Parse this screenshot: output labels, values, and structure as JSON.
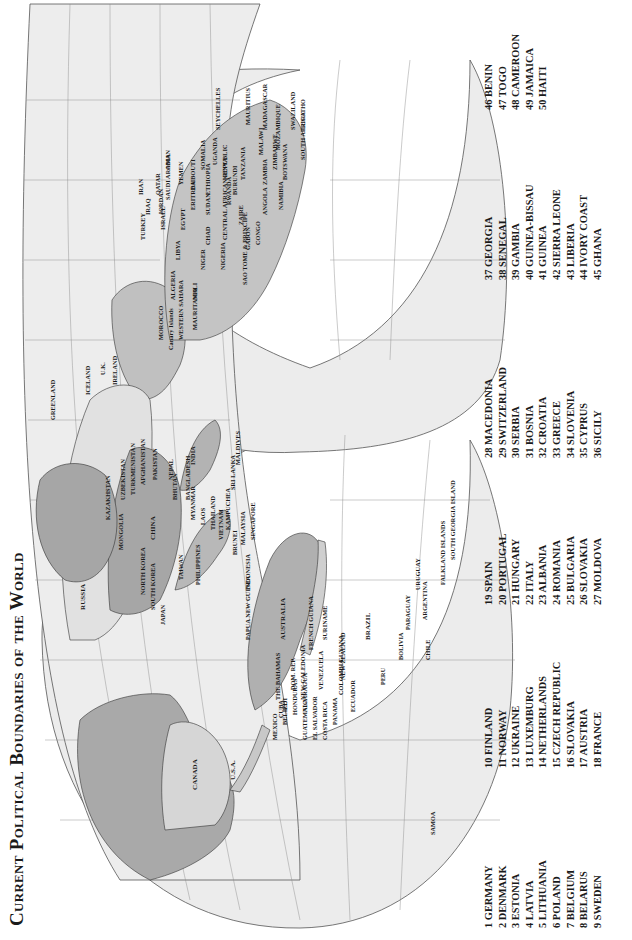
{
  "title": "Current Political Boundaries of the World",
  "legend": {
    "columns": [
      [
        {
          "num": 1,
          "name": "GERMANY"
        },
        {
          "num": 2,
          "name": "DENMARK"
        },
        {
          "num": 3,
          "name": "ESTONIA"
        },
        {
          "num": 4,
          "name": "LATVIA"
        },
        {
          "num": 5,
          "name": "LITHUANIA"
        },
        {
          "num": 6,
          "name": "POLAND"
        },
        {
          "num": 7,
          "name": "BELGIUM"
        },
        {
          "num": 8,
          "name": "BELARUS"
        },
        {
          "num": 9,
          "name": "SWEDEN"
        }
      ],
      [
        {
          "num": 10,
          "name": "FINLAND"
        },
        {
          "num": 11,
          "name": "NORWAY"
        },
        {
          "num": 12,
          "name": "UKRAINE"
        },
        {
          "num": 13,
          "name": "LUXEMBURG"
        },
        {
          "num": 14,
          "name": "NETHERLANDS"
        },
        {
          "num": 15,
          "name": "CZECH REPUBLIC"
        },
        {
          "num": 16,
          "name": "SLOVAKIA"
        },
        {
          "num": 17,
          "name": "AUSTRIA"
        },
        {
          "num": 18,
          "name": "FRANCE"
        }
      ],
      [
        {
          "num": 19,
          "name": "SPAIN"
        },
        {
          "num": 20,
          "name": "PORTUGAL"
        },
        {
          "num": 21,
          "name": "HUNGARY"
        },
        {
          "num": 22,
          "name": "ITALY"
        },
        {
          "num": 23,
          "name": "ALBANIA"
        },
        {
          "num": 24,
          "name": "ROMANIA"
        },
        {
          "num": 25,
          "name": "BULGARIA"
        },
        {
          "num": 26,
          "name": "SLOVAKIA"
        },
        {
          "num": 27,
          "name": "MOLDOVA"
        }
      ],
      [
        {
          "num": 28,
          "name": "MACEDONIA"
        },
        {
          "num": 29,
          "name": "SWITZERLAND"
        },
        {
          "num": 30,
          "name": "SERBIA"
        },
        {
          "num": 31,
          "name": "BOSNIA"
        },
        {
          "num": 32,
          "name": "CROATIA"
        },
        {
          "num": 33,
          "name": "GREECE"
        },
        {
          "num": 34,
          "name": "SLOVENIA"
        },
        {
          "num": 35,
          "name": "CYPRUS"
        },
        {
          "num": 36,
          "name": "SICILY"
        }
      ],
      [
        {
          "num": 37,
          "name": "GEORGIA"
        },
        {
          "num": 38,
          "name": "SENEGAL"
        },
        {
          "num": 39,
          "name": "GAMBIA"
        },
        {
          "num": 40,
          "name": "GUINEA-BISSAU"
        },
        {
          "num": 41,
          "name": "GUINEA"
        },
        {
          "num": 42,
          "name": "SIERRA LEONE"
        },
        {
          "num": 43,
          "name": "LIBERIA"
        },
        {
          "num": 44,
          "name": "IVORY COAST"
        },
        {
          "num": 45,
          "name": "GHANA"
        }
      ],
      [
        {
          "num": 46,
          "name": "BENIN"
        },
        {
          "num": 47,
          "name": "TOGO"
        },
        {
          "num": 48,
          "name": "CAMEROON"
        },
        {
          "num": 49,
          "name": "JAMAICA"
        },
        {
          "num": 50,
          "name": "HAITI"
        }
      ]
    ]
  },
  "labels": {
    "americas": [
      "CANADA",
      "U.S.A.",
      "MEXICO",
      "BELIZE",
      "GUATEMALA",
      "EL SALVADOR",
      "HONDURAS",
      "NICARAGUA",
      "COSTA RICA",
      "PANAMA",
      "CUBA",
      "THE BAHAMAS",
      "DOM. REP.",
      "VENEZUELA",
      "FRENCH GUIANA",
      "SURINAME",
      "GUYANA",
      "COLOMBIA",
      "ECUADOR",
      "PERU",
      "BRAZIL",
      "BOLIVIA",
      "PARAGUAY",
      "CHILE",
      "ARGENTINA",
      "URUGUAY",
      "FALKLAND ISLANDS",
      "SOUTH GEORGIA ISLAND",
      "SAMOA"
    ],
    "europe_africa": [
      "GREENLAND",
      "ICELAND",
      "U.K.",
      "IRELAND",
      "MOROCCO",
      "Canary Islands",
      "WESTERN SAHARA",
      "MAURITANIA",
      "MALI",
      "ALGERIA",
      "LIBYA",
      "EGYPT",
      "NIGER",
      "CHAD",
      "SUDAN",
      "NIGERIA",
      "CENTRAL AFRICAN REPUBLIC",
      "ZAIRE",
      "GABON",
      "CONGO",
      "SAO TOME & PRINCIPE",
      "ANGOLA",
      "NAMIBIA",
      "BOTSWANA",
      "ZAMBIA",
      "ZIMBABWE",
      "MOZAMBIQUE",
      "MALAWI",
      "SOUTH AFRICA",
      "LESOTHO",
      "SWAZILAND",
      "MADAGASCAR",
      "MAURITIUS",
      "TANZANIA",
      "BURUNDI",
      "RWANDA",
      "KENYA",
      "UGANDA",
      "SOMALIA",
      "ETHIOPIA",
      "DJIBOUTI",
      "ERITREA",
      "YEMEN",
      "OMAN",
      "SAUDI ARABIA",
      "QATAR",
      "JORDAN",
      "ISRAEL",
      "IRAQ",
      "TURKEY",
      "IRAN",
      "SEYCHELLES"
    ],
    "asia_oceania": [
      "RUSSIA",
      "KAZAKHSTAN",
      "UZBEKISTAN",
      "TURKMENISTAN",
      "AFGHANISTAN",
      "PAKISTAN",
      "INDIA",
      "NEPAL",
      "BHUTAN",
      "BANGLADESH",
      "MYANMAR",
      "CHINA",
      "MONGOLIA",
      "NORTH KOREA",
      "SOUTH KOREA",
      "JAPAN",
      "TAIWAN",
      "LAOS",
      "THAILAND",
      "VIETNAM",
      "KAMPUCHEA",
      "PHILIPPINES",
      "MALAYSIA",
      "BRUNEI",
      "SINGAPORE",
      "INDONESIA",
      "SRI LANKA",
      "MALDIVES",
      "PAPUA NEW GUINEA",
      "AUSTRALIA",
      "NEW ZEALAND",
      "NEW CALEDONIA",
      "FIJI"
    ]
  },
  "colors": {
    "ocean": "#eeeeee",
    "land_light": "#dcdcdc",
    "land_mid": "#b9b9b9",
    "land_dark": "#a5a5a5",
    "gridline": "#8a8a8a",
    "ink": "#1a1a1a"
  }
}
